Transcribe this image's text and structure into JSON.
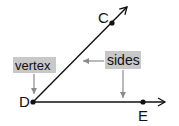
{
  "diagram": {
    "points": [
      {
        "id": "D",
        "label": "D",
        "x": 33,
        "y": 102
      },
      {
        "id": "C",
        "label": "C",
        "x": 112,
        "y": 23
      },
      {
        "id": "E",
        "label": "E",
        "x": 143,
        "y": 102
      }
    ],
    "rays": [
      {
        "from": "D",
        "through": "C"
      },
      {
        "from": "D",
        "through": "E"
      }
    ],
    "callouts": {
      "vertex": {
        "label": "vertex"
      },
      "sides": {
        "label": "sides"
      }
    },
    "colors": {
      "line": "#111111",
      "callout_bg": "#c8c8c8",
      "callout_arrow": "#8a8a8a"
    }
  }
}
